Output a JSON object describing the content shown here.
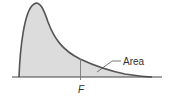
{
  "diagram": {
    "type": "F-distribution density curve",
    "labels": {
      "area": "Area",
      "critical_value": "F"
    },
    "colors": {
      "curve_stroke": "#555555",
      "area_fill": "#dcdcdc",
      "axis": "#444444",
      "text": "#333333"
    },
    "shaded_region": "entire area under the curve"
  }
}
